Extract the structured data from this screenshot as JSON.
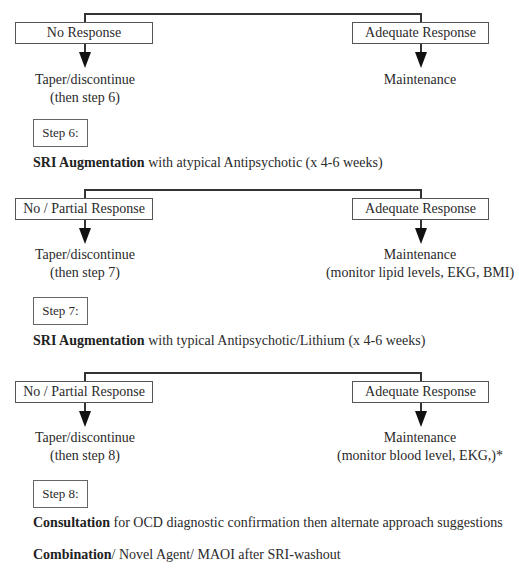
{
  "sections": [
    {
      "left_box": "No Response",
      "right_box": "Adequate Response",
      "left_outcome": [
        "Taper/discontinue",
        "(then step 6)"
      ],
      "right_outcome": [
        "Maintenance"
      ]
    },
    {
      "left_box": "No / Partial Response",
      "right_box": "Adequate Response",
      "left_outcome": [
        "Taper/discontinue",
        "(then step 7)"
      ],
      "right_outcome": [
        "Maintenance",
        "(monitor lipid levels, EKG, BMI)"
      ]
    },
    {
      "left_box": "No / Partial Response",
      "right_box": "Adequate Response",
      "left_outcome": [
        "Taper/discontinue",
        "(then step 8)"
      ],
      "right_outcome": [
        "Maintenance",
        "(monitor blood level, EKG,)*"
      ]
    }
  ],
  "steps": [
    {
      "label": "Step 6:",
      "bold": "SRI Augmentation",
      "text": " with atypical Antipsychotic (x 4-6 weeks)"
    },
    {
      "label": "Step 7:",
      "bold": "SRI Augmentation",
      "text": " with typical Antipsychotic/Lithium (x 4-6 weeks)"
    },
    {
      "label": "Step 8:",
      "bold": "Consultation",
      "text": " for OCD diagnostic confirmation then alternate approach suggestions"
    }
  ],
  "extra": {
    "bold": "Combination",
    "text": "/ Novel Agent/ MAOI after SRI-washout"
  }
}
